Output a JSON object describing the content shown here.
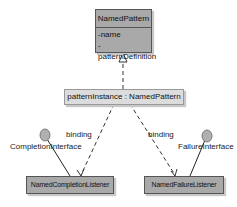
{
  "diagram": {
    "pattern_class": {
      "name": "NamedPattern",
      "attributes": [
        "-name",
        "-patternDefinition"
      ]
    },
    "instance": {
      "label": "patternInstance : NamedPattern"
    },
    "bindings": [
      {
        "label": "binding",
        "target": "NamedCompletionListener"
      },
      {
        "label": "binding",
        "target": "NamedFailureListener"
      }
    ],
    "listeners": [
      {
        "name": "NamedCompletionListener",
        "interface": "CompletionInterface"
      },
      {
        "name": "NamedFailureListener",
        "interface": "FailureInterface"
      }
    ],
    "colors": {
      "class_fill": "#a9a9a9",
      "instance_fill": "#dcdcdc",
      "interface_fill": "#b0b0b0",
      "line": "#333333"
    }
  }
}
